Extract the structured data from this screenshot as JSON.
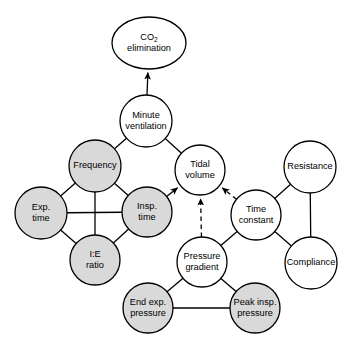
{
  "diagram": {
    "canvas": {
      "width": 352,
      "height": 349
    },
    "style": {
      "shaded_fill": "#d9d9d9",
      "plain_fill": "#ffffff",
      "stroke": "#000000",
      "background": "#ffffff"
    },
    "nodes": [
      {
        "id": "co2",
        "label_lines": [
          "CO2",
          "elimination"
        ],
        "label_html": "CO<sub>2</sub> elimination",
        "shape": "ellipse",
        "fill": "plain",
        "cx": 149,
        "cy": 43,
        "rx": 37,
        "ry": 26
      },
      {
        "id": "minute_ventilation",
        "label_lines": [
          "Minute",
          "ventilation"
        ],
        "shape": "circle",
        "fill": "plain",
        "cx": 146,
        "cy": 121,
        "rx": 26,
        "ry": 26
      },
      {
        "id": "frequency",
        "label_lines": [
          "Frequency"
        ],
        "shape": "circle",
        "fill": "shaded",
        "cx": 95,
        "cy": 166,
        "rx": 26,
        "ry": 26
      },
      {
        "id": "tidal_volume",
        "label_lines": [
          "Tidal",
          "volume"
        ],
        "shape": "circle",
        "fill": "plain",
        "cx": 200,
        "cy": 170,
        "rx": 25,
        "ry": 25
      },
      {
        "id": "resistance",
        "label_lines": [
          "Resistance"
        ],
        "shape": "circle",
        "fill": "plain",
        "cx": 310,
        "cy": 167,
        "rx": 26,
        "ry": 26
      },
      {
        "id": "exp_time",
        "label_lines": [
          "Exp.",
          "time"
        ],
        "shape": "circle",
        "fill": "shaded",
        "cx": 41,
        "cy": 213,
        "rx": 26,
        "ry": 26
      },
      {
        "id": "insp_time",
        "label_lines": [
          "Insp.",
          "time"
        ],
        "shape": "circle",
        "fill": "shaded",
        "cx": 147,
        "cy": 212,
        "rx": 25,
        "ry": 25
      },
      {
        "id": "time_constant",
        "label_lines": [
          "Time",
          "constant"
        ],
        "shape": "circle",
        "fill": "plain",
        "cx": 256,
        "cy": 215,
        "rx": 25,
        "ry": 25
      },
      {
        "id": "ie_ratio",
        "label_lines": [
          "I:E",
          "ratio"
        ],
        "shape": "circle",
        "fill": "shaded",
        "cx": 95,
        "cy": 260,
        "rx": 25,
        "ry": 25
      },
      {
        "id": "pressure_gradient",
        "label_lines": [
          "Pressure",
          "gradient"
        ],
        "shape": "circle",
        "fill": "plain",
        "cx": 202,
        "cy": 262,
        "rx": 25,
        "ry": 25
      },
      {
        "id": "compliance",
        "label_lines": [
          "Compliance"
        ],
        "shape": "circle",
        "fill": "plain",
        "cx": 311,
        "cy": 263,
        "rx": 26,
        "ry": 26
      },
      {
        "id": "end_exp_pressure",
        "label_lines": [
          "End exp.",
          "pressure"
        ],
        "shape": "circle",
        "fill": "shaded",
        "cx": 148,
        "cy": 308,
        "rx": 25,
        "ry": 25
      },
      {
        "id": "peak_insp_pressure",
        "label_lines": [
          "Peak insp.",
          "pressure"
        ],
        "shape": "circle",
        "fill": "shaded",
        "cx": 255,
        "cy": 308,
        "rx": 25,
        "ry": 25
      }
    ],
    "edges": [
      {
        "from": "minute_ventilation",
        "to": "co2",
        "style": "solid",
        "arrow": true
      },
      {
        "from": "frequency",
        "to": "minute_ventilation",
        "style": "solid",
        "arrow": false
      },
      {
        "from": "tidal_volume",
        "to": "minute_ventilation",
        "style": "solid",
        "arrow": false
      },
      {
        "from": "frequency",
        "to": "exp_time",
        "style": "solid",
        "arrow": false
      },
      {
        "from": "frequency",
        "to": "insp_time",
        "style": "solid",
        "arrow": false
      },
      {
        "from": "frequency",
        "to": "ie_ratio",
        "style": "solid",
        "arrow": false
      },
      {
        "from": "exp_time",
        "to": "insp_time",
        "style": "solid",
        "arrow": false
      },
      {
        "from": "exp_time",
        "to": "ie_ratio",
        "style": "solid",
        "arrow": false
      },
      {
        "from": "insp_time",
        "to": "ie_ratio",
        "style": "solid",
        "arrow": false
      },
      {
        "from": "insp_time",
        "to": "tidal_volume",
        "style": "solid",
        "arrow": true
      },
      {
        "from": "pressure_gradient",
        "to": "tidal_volume",
        "style": "dashed",
        "arrow": true
      },
      {
        "from": "time_constant",
        "to": "tidal_volume",
        "style": "dashed",
        "arrow": true
      },
      {
        "from": "time_constant",
        "to": "resistance",
        "style": "solid",
        "arrow": false
      },
      {
        "from": "time_constant",
        "to": "compliance",
        "style": "solid",
        "arrow": false
      },
      {
        "from": "time_constant",
        "to": "pressure_gradient",
        "style": "solid",
        "arrow": false
      },
      {
        "from": "resistance",
        "to": "compliance",
        "style": "solid",
        "arrow": false
      },
      {
        "from": "pressure_gradient",
        "to": "end_exp_pressure",
        "style": "solid",
        "arrow": false
      },
      {
        "from": "pressure_gradient",
        "to": "peak_insp_pressure",
        "style": "solid",
        "arrow": false
      },
      {
        "from": "end_exp_pressure",
        "to": "peak_insp_pressure",
        "style": "solid",
        "arrow": false
      }
    ]
  }
}
